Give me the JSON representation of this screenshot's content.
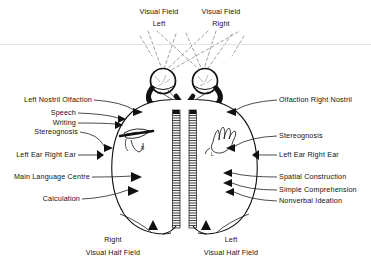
{
  "figure": {
    "background_color": "#ffffff",
    "ink_color": "#111111",
    "dashed_color": "#8a8a8a"
  },
  "top_labels": {
    "left_field_line1": "Visual Field",
    "left_field_line2": "Left",
    "right_field_line1": "Visual Field",
    "right_field_line2": "Right"
  },
  "left_labels": [
    {
      "id": "left-nostril-olfaction",
      "text": "Left Nostril  Olfaction"
    },
    {
      "id": "speech",
      "text": "Speech"
    },
    {
      "id": "writing",
      "text": "Writing"
    },
    {
      "id": "stereognosis-left",
      "text": "Stereognosis"
    },
    {
      "id": "left-ear-right-ear-left",
      "text": "Left Ear  Right Ear"
    },
    {
      "id": "main-language-centre",
      "text": "Main Language Centre"
    },
    {
      "id": "calculation",
      "text": "Calculation"
    }
  ],
  "right_labels": [
    {
      "id": "olfaction-right-nostril",
      "text": "Olfaction  Right Nostril"
    },
    {
      "id": "stereognosis-right",
      "text": "Stereognosis"
    },
    {
      "id": "left-ear-right-ear-right",
      "text": "Left Ear   Right Ear"
    },
    {
      "id": "spatial-construction",
      "text": "Spatial Construction"
    },
    {
      "id": "simple-comprehension",
      "text": "Simple Comprehension"
    },
    {
      "id": "nonverbal-ideation",
      "text": "Nonverbal Ideation"
    }
  ],
  "bottom_labels": {
    "left_side_line1": "Right",
    "left_side_line2": "Visual Half Field",
    "right_side_line1": "Left",
    "right_side_line2": "Visual Half Field"
  },
  "anatomy": {
    "left_eye": "left-eye",
    "right_eye": "right-eye",
    "optic_chiasm": "optic-chiasm",
    "corpus_callosum": "corpus-callosum",
    "left_hemisphere": "left-hemisphere",
    "right_hemisphere": "right-hemisphere",
    "writing_hand": "writing-hand-holding-pen",
    "mouth": "mouth-speech",
    "open_hand": "open-left-hand",
    "hand_label_r": "R",
    "hand_label_l": "L"
  }
}
